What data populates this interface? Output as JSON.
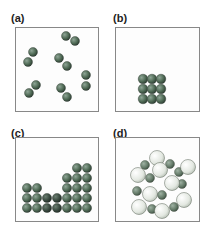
{
  "panels": [
    {
      "label": "(a)",
      "description": "gas: diatomic molecules spread apart"
    },
    {
      "label": "(b)",
      "description": "solid: 3x3 packed cluster of atoms"
    },
    {
      "label": "(c)",
      "description": "liquid/solid layers of atoms filling bottom"
    },
    {
      "label": "(d)",
      "description": "ionic crystal lattice of large and small spheres"
    }
  ],
  "colors": {
    "dark_sphere": "#4f6a55",
    "darker_sphere": "#3a4a40",
    "light_sphere": "#e8ece6",
    "small_sphere": "#6f8572",
    "border": "#888888"
  }
}
